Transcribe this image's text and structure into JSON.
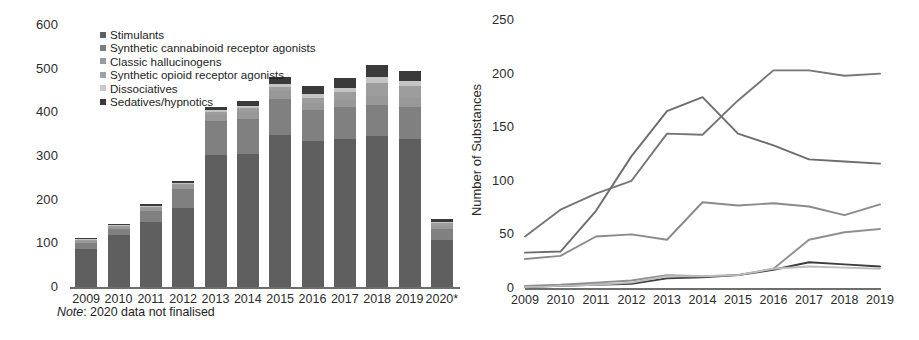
{
  "chart_data": [
    {
      "type": "bar",
      "id": "nps-reported-by-category",
      "title": "",
      "subtype": "stacked",
      "xlabel": "",
      "ylabel": "",
      "ylim": [
        0,
        600
      ],
      "yticks": [
        0,
        100,
        200,
        300,
        400,
        500,
        600
      ],
      "grid": false,
      "legend_position": "upper-left-inside",
      "annotation": "Note: 2020 data not finalised",
      "annotation_italic_prefix": "Note",
      "categories": [
        "2009",
        "2010",
        "2011",
        "2012",
        "2013",
        "2014",
        "2015",
        "2016",
        "2017",
        "2018",
        "2019",
        "2020*"
      ],
      "series": [
        {
          "name": "Stimulants",
          "color": "#5f5f5f",
          "values": [
            88,
            118,
            150,
            180,
            302,
            305,
            348,
            335,
            340,
            345,
            338,
            108
          ]
        },
        {
          "name": "Synthetic cannabinoid receptor agonists",
          "color": "#808080",
          "values": [
            13,
            15,
            24,
            45,
            78,
            80,
            83,
            70,
            72,
            72,
            75,
            26
          ]
        },
        {
          "name": "Classic hallucinogens",
          "color": "#989898",
          "values": [
            4,
            4,
            6,
            8,
            14,
            16,
            18,
            17,
            17,
            21,
            19,
            6
          ]
        },
        {
          "name": "Synthetic opioid receptor agonists",
          "color": "#9d9d9d",
          "values": [
            2,
            2,
            3,
            3,
            6,
            8,
            10,
            12,
            18,
            30,
            28,
            7
          ]
        },
        {
          "name": "Dissociatives",
          "color": "#c4c4c4",
          "values": [
            2,
            2,
            3,
            3,
            5,
            6,
            6,
            8,
            9,
            12,
            11,
            3
          ]
        },
        {
          "name": "Sedatives/hypnotics",
          "color": "#3a3a3a",
          "values": [
            3,
            3,
            4,
            4,
            8,
            11,
            17,
            18,
            22,
            29,
            24,
            5
          ]
        }
      ],
      "totals": [
        112,
        144,
        190,
        243,
        413,
        426,
        482,
        460,
        478,
        509,
        495,
        155
      ]
    },
    {
      "type": "line",
      "id": "nps-substances-per-year",
      "title": "",
      "xlabel": "",
      "ylabel": "Number of Substances",
      "ylim": [
        0,
        250
      ],
      "yticks": [
        0,
        50,
        100,
        150,
        200,
        250
      ],
      "grid": false,
      "legend_position": "none",
      "x": [
        "2009",
        "2010",
        "2011",
        "2012",
        "2013",
        "2014",
        "2015",
        "2016",
        "2017",
        "2018",
        "2019"
      ],
      "series": [
        {
          "name": "Stimulants",
          "color": "#767676",
          "values": [
            48,
            73,
            88,
            100,
            144,
            143,
            175,
            203,
            203,
            198,
            200
          ]
        },
        {
          "name": "Synthetic cannabinoid receptor agonists",
          "color": "#6d6d6d",
          "values": [
            33,
            34,
            72,
            123,
            165,
            178,
            144,
            133,
            120,
            118,
            116
          ]
        },
        {
          "name": "Classic hallucinogens",
          "color": "#8a8a8a",
          "values": [
            27,
            30,
            48,
            50,
            45,
            80,
            77,
            79,
            76,
            68,
            78
          ]
        },
        {
          "name": "Synthetic opioid receptor agonists",
          "color": "#909090",
          "values": [
            2,
            3,
            5,
            7,
            12,
            11,
            12,
            18,
            45,
            52,
            55
          ]
        },
        {
          "name": "Dissociatives",
          "color": "#3d3d3d",
          "values": [
            1,
            2,
            3,
            4,
            9,
            10,
            12,
            17,
            24,
            22,
            20
          ]
        },
        {
          "name": "Sedatives/hypnotics",
          "color": "#bdbdbd",
          "values": [
            1,
            2,
            3,
            5,
            11,
            11,
            12,
            18,
            20,
            19,
            18
          ]
        }
      ]
    }
  ],
  "bar_chart": {
    "y_ticks": [
      "600",
      "500",
      "400",
      "300",
      "200",
      "100",
      "0"
    ],
    "x_ticks": [
      "2009",
      "2010",
      "2011",
      "2012",
      "2013",
      "2014",
      "2015",
      "2016",
      "2017",
      "2018",
      "2019",
      "2020*"
    ],
    "legend": [
      {
        "label": "Stimulants",
        "color": "#5f5f5f"
      },
      {
        "label": "Synthetic cannabinoid receptor agonists",
        "color": "#7d7d7d"
      },
      {
        "label": "Classic hallucinogens",
        "color": "#9a9a9a"
      },
      {
        "label": "Synthetic opioid receptor agonists",
        "color": "#a2a2a2"
      },
      {
        "label": "Dissociatives",
        "color": "#c9c9c9"
      },
      {
        "label": "Sedatives/hypnotics",
        "color": "#3a3a3a"
      }
    ],
    "note_prefix": "Note",
    "note_text": ": 2020 data not finalised"
  },
  "line_chart": {
    "y_axis_title": "Number of Substances",
    "y_ticks": [
      "250",
      "200",
      "150",
      "100",
      "50",
      "0"
    ],
    "x_ticks": [
      "2009",
      "2010",
      "2011",
      "2012",
      "2013",
      "2014",
      "2015",
      "2016",
      "2017",
      "2018",
      "2019"
    ]
  }
}
